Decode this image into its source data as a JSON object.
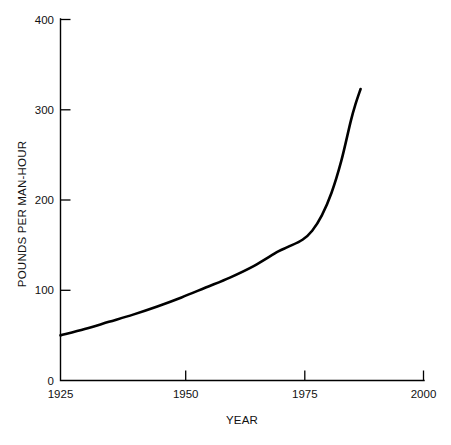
{
  "chart_data": {
    "type": "line",
    "title": "",
    "xlabel": "YEAR",
    "ylabel": "POUNDS PER MAN-HOUR",
    "xlim": [
      1925,
      2000
    ],
    "ylim": [
      0,
      400
    ],
    "grid": false,
    "legend": null,
    "x_ticks": [
      "1925",
      "1950",
      "1975",
      "2000"
    ],
    "x_tick_values": [
      1925,
      1950,
      1975,
      2000
    ],
    "y_ticks": [
      "0",
      "100",
      "200",
      "300",
      "400"
    ],
    "y_tick_values": [
      0,
      100,
      200,
      300,
      400
    ],
    "series": [
      {
        "name": "Pounds per man-hour",
        "color": "#000000",
        "x": [
          1925,
          1930,
          1935,
          1940,
          1945,
          1950,
          1955,
          1960,
          1965,
          1970,
          1972,
          1975,
          1977,
          1979,
          1981,
          1983,
          1985,
          1986,
          1987
        ],
        "values": [
          50,
          57,
          65,
          73,
          82,
          92,
          103,
          114,
          127,
          143,
          148,
          156,
          166,
          183,
          208,
          243,
          288,
          307,
          323
        ]
      }
    ],
    "annotations": []
  },
  "axis": {
    "y_label": "POUNDS PER MAN-HOUR",
    "x_label": "YEAR"
  },
  "colors": {
    "curve": "#000000",
    "axis": "#000000",
    "background": "#ffffff"
  }
}
